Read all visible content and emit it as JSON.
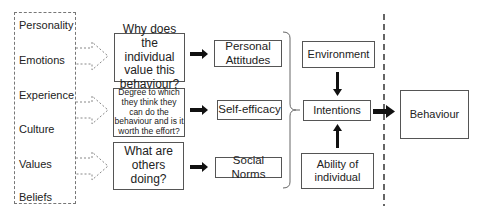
{
  "factors": {
    "items": [
      "Personality",
      "Emotions",
      "Experience",
      "Culture",
      "Values",
      "Beliefs"
    ]
  },
  "questions": [
    "Why does the individual value this behaviour?",
    "Degree to which they think they can do the behaviour and is it worth the effort?",
    "What are others doing?"
  ],
  "determinants": [
    "Personal Attitudes",
    "Self-efficacy",
    "Social Norms"
  ],
  "center": {
    "environment": "Environment",
    "intentions": "Intentions",
    "ability": "Ability of individual"
  },
  "outcome": "Behaviour",
  "colors": {
    "border": "#555555",
    "arrow": "#111111",
    "dashed": "#777777"
  }
}
